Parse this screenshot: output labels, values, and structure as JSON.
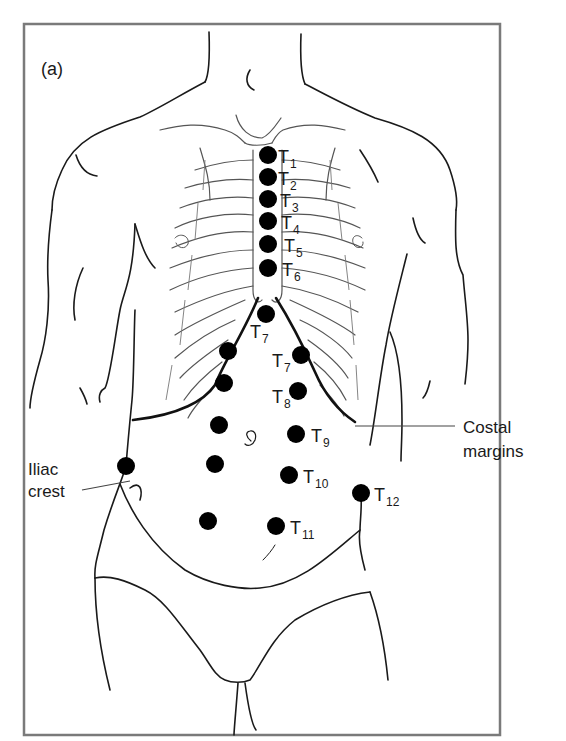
{
  "figure": {
    "panel_label": "(a)"
  },
  "callouts": {
    "costal": {
      "line1": "Costal",
      "line2": "margins"
    },
    "iliac": {
      "line1": "Iliac",
      "line2": "crest"
    }
  },
  "points": [
    {
      "id": "T1",
      "prefix": "T",
      "sub": "1",
      "cx": 268,
      "cy": 155,
      "lx": 278,
      "ly": 163,
      "sx": 290,
      "sy": 168
    },
    {
      "id": "T2",
      "prefix": "T",
      "sub": "2",
      "cx": 268,
      "cy": 177,
      "lx": 278,
      "ly": 185,
      "sx": 290,
      "sy": 190
    },
    {
      "id": "T3",
      "prefix": "T",
      "sub": "3",
      "cx": 268,
      "cy": 199,
      "lx": 280,
      "ly": 207,
      "sx": 292,
      "sy": 212
    },
    {
      "id": "T4",
      "prefix": "T",
      "sub": "4",
      "cx": 268,
      "cy": 221,
      "lx": 281,
      "ly": 229,
      "sx": 293,
      "sy": 234
    },
    {
      "id": "T5",
      "prefix": "T",
      "sub": "5",
      "cx": 268,
      "cy": 244,
      "lx": 284,
      "ly": 252,
      "sx": 296,
      "sy": 257
    },
    {
      "id": "T6",
      "prefix": "T",
      "sub": "6",
      "cx": 268,
      "cy": 268,
      "lx": 282,
      "ly": 276,
      "sx": 294,
      "sy": 281
    },
    {
      "id": "T7a",
      "prefix": "T",
      "sub": "7",
      "cx": 266,
      "cy": 314,
      "lx": 250,
      "ly": 338,
      "sx": 262,
      "sy": 343
    },
    {
      "id": "T7b",
      "prefix": "T",
      "sub": "7",
      "cx": 301,
      "cy": 355,
      "lx": 272,
      "ly": 367,
      "sx": 284,
      "sy": 372
    },
    {
      "id": "T8",
      "prefix": "T",
      "sub": "8",
      "cx": 298,
      "cy": 391,
      "lx": 272,
      "ly": 403,
      "sx": 284,
      "sy": 408
    },
    {
      "id": "T9",
      "prefix": "T",
      "sub": "9",
      "cx": 296,
      "cy": 434,
      "lx": 311,
      "ly": 442,
      "sx": 323,
      "sy": 447
    },
    {
      "id": "T10",
      "prefix": "T",
      "sub": "10",
      "cx": 289,
      "cy": 475,
      "lx": 303,
      "ly": 483,
      "sx": 315,
      "sy": 488
    },
    {
      "id": "T11",
      "prefix": "T",
      "sub": "11",
      "cx": 276,
      "cy": 526,
      "lx": 290,
      "ly": 534,
      "sx": 302,
      "sy": 539
    },
    {
      "id": "T12",
      "prefix": "T",
      "sub": "12",
      "cx": 361,
      "cy": 493,
      "lx": 374,
      "ly": 501,
      "sx": 386,
      "sy": 506
    }
  ],
  "unlabeled_points": [
    {
      "cx": 228,
      "cy": 351
    },
    {
      "cx": 224,
      "cy": 383
    },
    {
      "cx": 219,
      "cy": 425
    },
    {
      "cx": 215,
      "cy": 464
    },
    {
      "cx": 208,
      "cy": 521
    },
    {
      "cx": 126,
      "cy": 466
    }
  ],
  "colors": {
    "dot": "#000000",
    "frame": "#7a7a7a",
    "line": "#1a1a1a"
  }
}
